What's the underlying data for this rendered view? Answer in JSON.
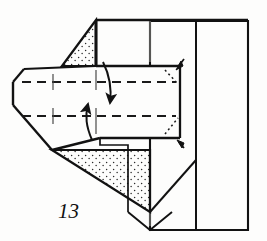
{
  "figure": {
    "kind": "origami-fold-diagram",
    "step_number": "13",
    "caption": "",
    "ink_color": "#121212",
    "paper_color": "#fdfdfc",
    "stipple_color": "#2a2a2a",
    "crease_color": "#1a1a1a",
    "canvas": {
      "width": 267,
      "height": 241
    }
  },
  "layers": {
    "back_panel_label": "back panel",
    "upper_shaded_flap_label": "upper shaded flap",
    "lower_shaded_flap_label": "lower shaded flap",
    "center_band_label": "center horizontal band",
    "left_point_label": "left blunt point",
    "bottom_notch_label": "bottom v notch"
  },
  "creases": {
    "upper_valley_label": "upper valley crease",
    "lower_valley_label": "lower valley crease",
    "hidden_edge_label": "hidden edge",
    "center_vertical_label": "center vertical crease",
    "tick_label": "short crease tick"
  },
  "arrows": {
    "fold_down_label": "fold down arrow",
    "fold_up_label": "fold up arrow",
    "top_right_tuck_label": "tuck arrow top right",
    "bottom_right_tuck_label": "tuck arrow bottom right"
  },
  "geometry": {
    "outer_right_panel": "195,20 248,20 248,230 150,230 150,20",
    "top_edge": "95,20 248,20",
    "left_body_outline": "13,82 22,70 95,66 180,66 180,138 100,138 52,150 13,105 13,82",
    "upper_stipple_triangle": "95,20 95,66 62,66 95,20",
    "lower_stipple_triangle": "52,150 150,150 150,212 52,150",
    "bottom_v": "128,212 150,230 172,212"
  },
  "annotations": {
    "upper_dash_y": 82,
    "lower_dash_y": 116,
    "dash_x_start": 22,
    "dash_x_end": 176
  }
}
